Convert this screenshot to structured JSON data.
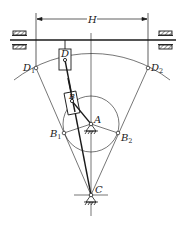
{
  "diagram": {
    "type": "guide-bar (swinging slider) quick-return mechanism",
    "colors": {
      "line": "#1a1a1a",
      "background": "#ffffff"
    },
    "dimension": {
      "label": "H"
    },
    "labels": {
      "D": "D",
      "B": "B",
      "A": "A",
      "C": "C",
      "D1_main": "D",
      "D1_sub": "1",
      "D2_main": "D",
      "D2_sub": "2",
      "B1_main": "B",
      "B1_sub": "1",
      "B2_main": "B",
      "B2_sub": "2"
    },
    "points": {
      "A": [
        91,
        124
      ],
      "C": [
        91,
        195
      ],
      "B": [
        72,
        98
      ],
      "D": [
        65,
        60
      ],
      "B1": [
        64,
        133
      ],
      "B2": [
        118,
        133
      ],
      "D1": [
        36,
        68
      ],
      "D2": [
        148,
        68
      ]
    },
    "crank_circle_radius": 28
  }
}
